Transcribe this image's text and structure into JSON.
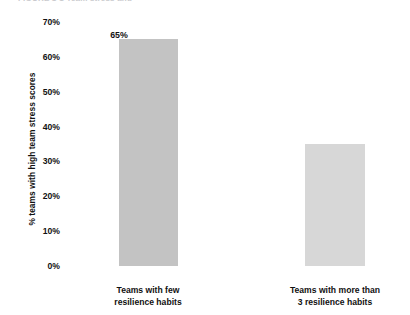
{
  "chart_data": {
    "type": "bar",
    "title": "",
    "subtitle": "",
    "xlabel": "",
    "ylabel": "% teams with high team stress scores",
    "categories": [
      "Teams with few resilience habits",
      "Teams with more than 3 resilience habits"
    ],
    "category_lines": [
      [
        "Teams with few",
        "resilience habits"
      ],
      [
        "Teams with more than",
        "3 resilience habits"
      ]
    ],
    "values": [
      65,
      35
    ],
    "value_labels": [
      "65%",
      "35%"
    ],
    "bar_colors": [
      "#c3c3c3",
      "#d7d7d7"
    ],
    "ylim": [
      0,
      70
    ],
    "ytick_values": [
      0,
      10,
      20,
      30,
      40,
      50,
      60,
      70
    ],
    "ytick_labels": [
      "0%",
      "10%",
      "20%",
      "30%",
      "40%",
      "50%",
      "60%",
      "70%"
    ],
    "grid": false,
    "legend": false,
    "legend_position": "none",
    "axis_lines": false
  },
  "figure": {
    "clipped_title": "FIGURE 1-1  Team stress and"
  }
}
